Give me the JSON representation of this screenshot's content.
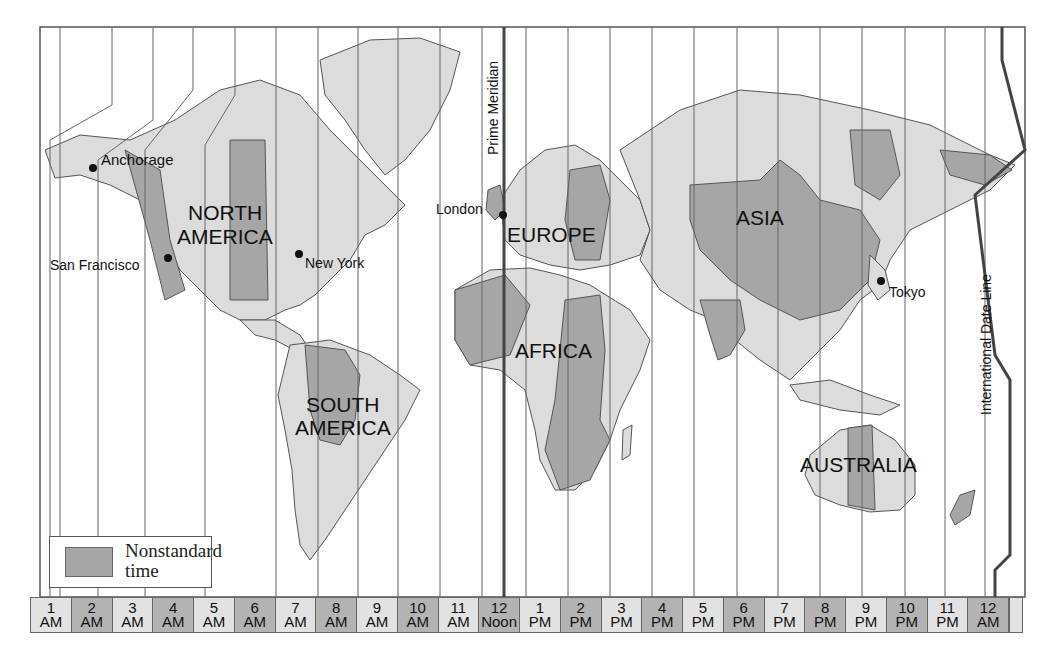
{
  "map": {
    "title": "World Time Zones",
    "colors": {
      "ocean": "#ffffff",
      "land_standard": "#dcdcdc",
      "land_nonstandard": "#a6a6a6",
      "border": "#555555",
      "meridian_line": "#444444"
    },
    "reference_lines": {
      "prime_meridian": "Prime Meridian",
      "date_line": "International Date Line"
    },
    "continents": [
      {
        "label_line1": "NORTH",
        "label_line2": "AMERICA"
      },
      {
        "label_line1": "SOUTH",
        "label_line2": "AMERICA"
      },
      {
        "label": "EUROPE"
      },
      {
        "label": "AFRICA"
      },
      {
        "label": "ASIA"
      },
      {
        "label": "AUSTRALIA"
      }
    ],
    "cities": [
      {
        "name": "Anchorage"
      },
      {
        "name": "San Francisco"
      },
      {
        "name": "New York"
      },
      {
        "name": "London"
      },
      {
        "name": "Tokyo"
      }
    ]
  },
  "legend": {
    "swatch_label": "Nonstandard time",
    "swatch_color": "#a6a6a6"
  },
  "time_bar": {
    "cells": [
      {
        "num": "1",
        "unit": "AM",
        "shade": "light"
      },
      {
        "num": "2",
        "unit": "AM",
        "shade": "dark"
      },
      {
        "num": "3",
        "unit": "AM",
        "shade": "light"
      },
      {
        "num": "4",
        "unit": "AM",
        "shade": "dark"
      },
      {
        "num": "5",
        "unit": "AM",
        "shade": "light"
      },
      {
        "num": "6",
        "unit": "AM",
        "shade": "dark"
      },
      {
        "num": "7",
        "unit": "AM",
        "shade": "light"
      },
      {
        "num": "8",
        "unit": "AM",
        "shade": "dark"
      },
      {
        "num": "9",
        "unit": "AM",
        "shade": "light"
      },
      {
        "num": "10",
        "unit": "AM",
        "shade": "dark"
      },
      {
        "num": "11",
        "unit": "AM",
        "shade": "light"
      },
      {
        "num": "12",
        "unit": "Noon",
        "shade": "dark"
      },
      {
        "num": "1",
        "unit": "PM",
        "shade": "light"
      },
      {
        "num": "2",
        "unit": "PM",
        "shade": "dark"
      },
      {
        "num": "3",
        "unit": "PM",
        "shade": "light"
      },
      {
        "num": "4",
        "unit": "PM",
        "shade": "dark"
      },
      {
        "num": "5",
        "unit": "PM",
        "shade": "light"
      },
      {
        "num": "6",
        "unit": "PM",
        "shade": "dark"
      },
      {
        "num": "7",
        "unit": "PM",
        "shade": "light"
      },
      {
        "num": "8",
        "unit": "PM",
        "shade": "dark"
      },
      {
        "num": "9",
        "unit": "PM",
        "shade": "light"
      },
      {
        "num": "10",
        "unit": "PM",
        "shade": "dark"
      },
      {
        "num": "11",
        "unit": "PM",
        "shade": "light"
      },
      {
        "num": "12",
        "unit": "AM",
        "shade": "dark"
      }
    ]
  }
}
